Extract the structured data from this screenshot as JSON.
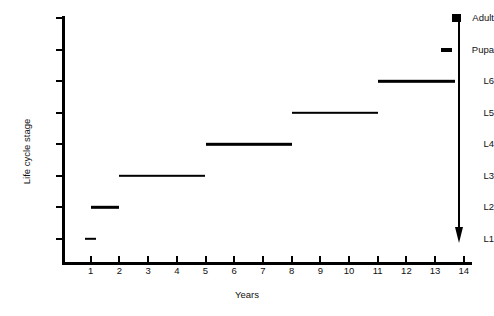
{
  "chart_data": {
    "type": "line",
    "title": "",
    "xlabel": "Years",
    "ylabel": "Life cycle stage",
    "xlim": [
      0,
      14.6
    ],
    "ylim": [
      0,
      8.6
    ],
    "grid": false,
    "legend": null,
    "x_ticks": [
      "1",
      "2",
      "3",
      "4",
      "5",
      "6",
      "7",
      "8",
      "9",
      "10",
      "11",
      "12",
      "13",
      "14"
    ],
    "x_tick_values": [
      1,
      2,
      3,
      4,
      5,
      6,
      7,
      8,
      9,
      10,
      11,
      12,
      13,
      14
    ],
    "y_ticks": [
      "L1",
      "L2",
      "L3",
      "L4",
      "L5",
      "L6",
      "Pupa",
      "Adult"
    ],
    "y_tick_values": [
      1,
      2,
      3,
      4,
      5,
      6,
      7,
      8
    ],
    "series": [
      {
        "name": "Life cycle stage duration",
        "segments": [
          {
            "stage": "L1",
            "stage_value": 1,
            "start_year": 0.8,
            "end_year": 1.2
          },
          {
            "stage": "L2",
            "stage_value": 2,
            "start_year": 1.0,
            "end_year": 2.0
          },
          {
            "stage": "L3",
            "stage_value": 3,
            "start_year": 2.0,
            "end_year": 5.0
          },
          {
            "stage": "L4",
            "stage_value": 4,
            "start_year": 5.0,
            "end_year": 8.0
          },
          {
            "stage": "L5",
            "stage_value": 5,
            "start_year": 8.0,
            "end_year": 11.0
          },
          {
            "stage": "L6",
            "stage_value": 6,
            "start_year": 11.0,
            "end_year": 13.7
          },
          {
            "stage": "Pupa",
            "stage_value": 7,
            "start_year": 13.2,
            "end_year": 13.6
          },
          {
            "stage": "Adult",
            "stage_value": 8,
            "start_year": 13.6,
            "end_year": 13.9
          }
        ]
      }
    ],
    "annotations": [
      {
        "name": "decline-arrow",
        "at_year": 14.0,
        "from_stage": "Adult",
        "to_stage": "L1",
        "direction": "down"
      }
    ]
  },
  "axes": {
    "y_title": "Life cycle stage",
    "x_title": "Years"
  }
}
